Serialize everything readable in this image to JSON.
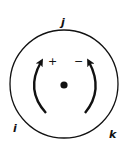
{
  "diagram": {
    "labels": {
      "top": "j",
      "bottom_left": "i",
      "bottom_right": "k"
    },
    "signs": {
      "left": "+",
      "right": "−"
    },
    "colors": {
      "stroke": "#111111",
      "background": "#ffffff"
    }
  }
}
